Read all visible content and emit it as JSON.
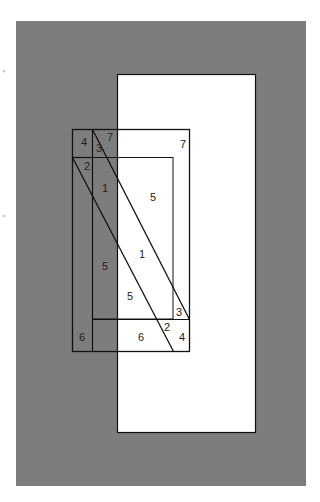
{
  "diagram": {
    "background_color": "#ffffff",
    "panel_color": "#7d7d7d",
    "line_color": "#111111",
    "region_labels": [
      {
        "id": "r4-top",
        "text": "4",
        "x": 84,
        "y": 146
      },
      {
        "id": "r3-top",
        "text": "3",
        "x": 99,
        "y": 152
      },
      {
        "id": "r7-left",
        "text": "7",
        "x": 110,
        "y": 141
      },
      {
        "id": "r7-right",
        "text": "7",
        "x": 183,
        "y": 148
      },
      {
        "id": "r2-left",
        "text": "2",
        "x": 87,
        "y": 170
      },
      {
        "id": "r1-upper",
        "text": "1",
        "x": 105,
        "y": 192
      },
      {
        "id": "r5-right",
        "text": "5",
        "x": 153,
        "y": 201
      },
      {
        "id": "r1-middle",
        "text": "1",
        "x": 142,
        "y": 258
      },
      {
        "id": "r5-left",
        "text": "5",
        "x": 105,
        "y": 270
      },
      {
        "id": "r5-lower",
        "text": "5",
        "x": 130,
        "y": 300
      },
      {
        "id": "r3-right",
        "text": "3",
        "x": 179,
        "y": 316
      },
      {
        "id": "r2-right",
        "text": "2",
        "x": 167,
        "y": 331
      },
      {
        "id": "r6-left",
        "text": "6",
        "x": 82,
        "y": 341
      },
      {
        "id": "r6-middle",
        "text": "6",
        "x": 141,
        "y": 341
      },
      {
        "id": "r4-right",
        "text": "4",
        "x": 182,
        "y": 341
      }
    ]
  }
}
